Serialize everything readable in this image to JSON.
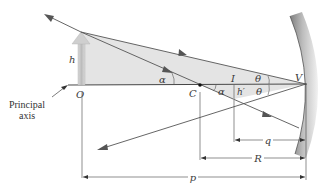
{
  "figure": {
    "type": "concave-mirror-ray-diagram",
    "colors": {
      "background": "#ffffff",
      "shaded_region": "#e2e2e2",
      "ray": "#555555",
      "axis": "#333333",
      "mirror_dark": "#8c8c8c",
      "mirror_light": "#e6e6e6",
      "object_arrow": "#c8c8c8"
    },
    "labels": {
      "object_height": "h",
      "object_point": "O",
      "center_of_curvature": "C",
      "image_point": "I",
      "image_height": "h′",
      "vertex": "V",
      "angle_alpha_object": "α",
      "angle_alpha_image": "α",
      "angle_theta_upper": "θ",
      "angle_theta_lower": "θ",
      "principal_axis_line1": "Principal",
      "principal_axis_line2": "axis"
    },
    "dimensions": {
      "image_distance": "q",
      "radius": "R",
      "object_distance": "p"
    }
  }
}
